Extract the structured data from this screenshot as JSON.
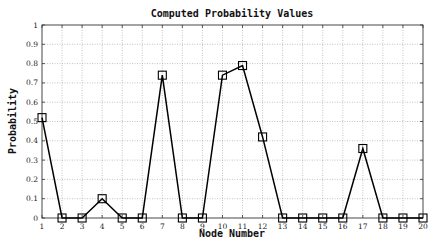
{
  "chart_data": {
    "type": "line",
    "title": "Computed Probability Values",
    "xlabel": "Node Number",
    "ylabel": "Probability",
    "x": [
      1,
      2,
      3,
      4,
      5,
      6,
      7,
      8,
      9,
      10,
      11,
      12,
      13,
      14,
      15,
      16,
      17,
      18,
      19,
      20
    ],
    "series": [
      {
        "name": "Probability",
        "marker": "square",
        "color": "#000000",
        "values": [
          0.52,
          0,
          0,
          0.1,
          0,
          0,
          0.74,
          0,
          0,
          0.74,
          0.79,
          0.42,
          0,
          0,
          0,
          0,
          0.36,
          0,
          0,
          0
        ]
      }
    ],
    "xlim": [
      1,
      20
    ],
    "ylim": [
      0,
      1
    ],
    "x_ticks": [
      "1",
      "2",
      "3",
      "4",
      "5",
      "6",
      "7",
      "8",
      "9",
      "10",
      "11",
      "12",
      "13",
      "14",
      "15",
      "16",
      "17",
      "18",
      "19",
      "20"
    ],
    "y_ticks": [
      "0",
      "0.1",
      "0.2",
      "0.3",
      "0.4",
      "0.5",
      "0.6",
      "0.7",
      "0.8",
      "0.9",
      "1"
    ],
    "grid": true,
    "legend": null
  }
}
